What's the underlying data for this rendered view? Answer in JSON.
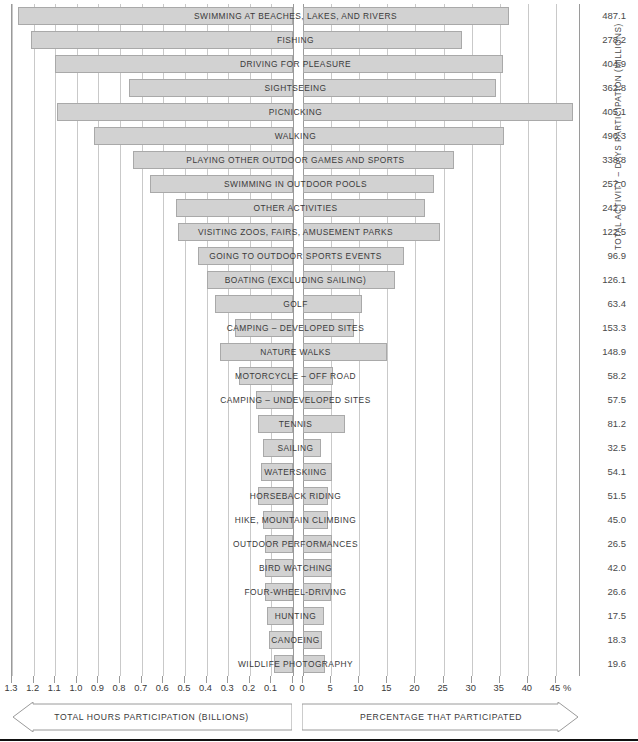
{
  "axes": {
    "left_title": "TOTAL HOURS PARTICIPATION (BILLIONS)",
    "right_title": "PERCENTAGE THAT PARTICIPATED",
    "value_column_title": "TOTAL ACTIVITY – DAYS PARTICIPATION (MILLIONS)",
    "percent_sign": "%",
    "left_ticks": [
      "1.3",
      "1.2",
      "1.1",
      "1.0",
      "0.9",
      "0.8",
      "0.7",
      "0.6",
      "0.5",
      "0.4",
      "0.3",
      "0.2",
      "0.1",
      "0"
    ],
    "right_ticks": [
      "0",
      "5",
      "10",
      "15",
      "20",
      "25",
      "30",
      "35",
      "40",
      "45"
    ]
  },
  "chart_data": {
    "type": "bar",
    "title": "",
    "subtitle": "",
    "orientation": "horizontal-bidirectional",
    "xlabel_left": "TOTAL HOURS PARTICIPATION (BILLIONS)",
    "xlabel_right": "PERCENTAGE THAT PARTICIPATED",
    "ylabel": "TOTAL ACTIVITY – DAYS PARTICIPATION (MILLIONS)",
    "xlim_left": [
      0,
      1.3
    ],
    "xlim_right": [
      0,
      45
    ],
    "grid": true,
    "legend": "none",
    "categories": [
      "SWIMMING AT BEACHES, LAKES, AND RIVERS",
      "FISHING",
      "DRIVING FOR PLEASURE",
      "SIGHTSEEING",
      "PICNICKING",
      "WALKING",
      "PLAYING OTHER OUTDOOR GAMES AND SPORTS",
      "SWIMMING IN OUTDOOR POOLS",
      "OTHER ACTIVITIES",
      "VISITING ZOOS, FAIRS, AMUSEMENT PARKS",
      "GOING TO OUTDOOR SPORTS EVENTS",
      "BOATING (EXCLUDING SAILING)",
      "GOLF",
      "CAMPING – DEVELOPED SITES",
      "NATURE WALKS",
      "MOTORCYCLE – OFF ROAD",
      "CAMPING – UNDEVELOPED SITES",
      "TENNIS",
      "SAILING",
      "WATERSKIING",
      "HORSEBACK RIDING",
      "HIKE, MOUNTAIN CLIMBING",
      "OUTDOOR PERFORMANCES",
      "BIRD WATCHING",
      "FOUR-WHEEL-DRIVING",
      "HUNTING",
      "CANOEING",
      "WILDLIFE PHOTOGRAPHY"
    ],
    "series": [
      {
        "name": "TOTAL HOURS PARTICIPATION (BILLIONS)",
        "axis": "left",
        "values": [
          1.27,
          1.21,
          1.1,
          0.76,
          1.09,
          0.92,
          0.74,
          0.66,
          0.54,
          0.53,
          0.44,
          0.4,
          0.36,
          0.27,
          0.34,
          0.25,
          0.17,
          0.16,
          0.14,
          0.15,
          0.16,
          0.14,
          0.13,
          0.13,
          0.13,
          0.12,
          0.11,
          0.09
        ]
      },
      {
        "name": "PERCENTAGE THAT PARTICIPATED",
        "axis": "right",
        "values": [
          36.6,
          28.3,
          35.6,
          34.4,
          48.0,
          35.7,
          26.8,
          23.3,
          21.7,
          24.3,
          17.9,
          16.3,
          10.5,
          9.0,
          14.9,
          5.3,
          5.2,
          7.5,
          3.2,
          5.1,
          4.5,
          4.4,
          5.1,
          5.2,
          5.0,
          3.8,
          3.3,
          4.0
        ]
      },
      {
        "name": "TOTAL ACTIVITY – DAYS PARTICIPATION (MILLIONS)",
        "axis": "value-column",
        "values": [
          487.1,
          278.2,
          404.9,
          362.8,
          405.1,
          496.3,
          338.8,
          257.0,
          242.9,
          122.5,
          96.9,
          126.1,
          63.4,
          153.3,
          148.9,
          58.2,
          57.5,
          81.2,
          32.5,
          54.1,
          51.5,
          45.0,
          26.5,
          42.0,
          26.6,
          17.5,
          18.3,
          19.6
        ]
      }
    ],
    "value_labels": [
      "487.1",
      "278.2",
      "404.9",
      "362.8",
      "405.1",
      "496.3",
      "338.8",
      "257.0",
      "242.9",
      "122.5",
      "96.9",
      "126.1",
      "63.4",
      "153.3",
      "148.9",
      "58.2",
      "57.5",
      "81.2",
      "32.5",
      "54.1",
      "51.5",
      "45.0",
      "26.5",
      "42.0",
      "26.6",
      "17.5",
      "18.3",
      "19.6"
    ]
  }
}
